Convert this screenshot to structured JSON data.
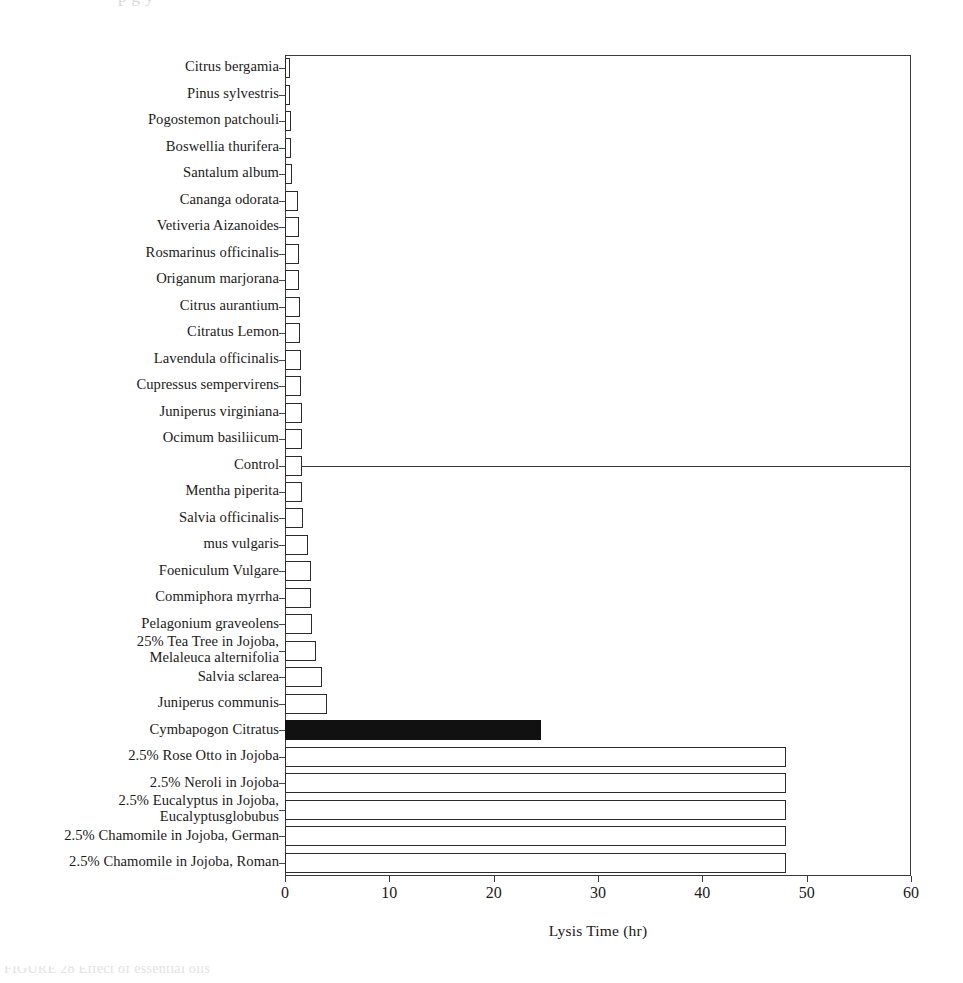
{
  "page": {
    "top_bleed_text": "p         g        y",
    "bottom_caption_fragment": "FIGURE  28    Effect of essential oils"
  },
  "chart_data": {
    "type": "bar",
    "orientation": "horizontal",
    "title": "",
    "xlabel": "Lysis Time (hr)",
    "ylabel": "",
    "xlim": [
      0,
      60
    ],
    "xticks": [
      0,
      10,
      20,
      30,
      40,
      50,
      60
    ],
    "xtick_labels": [
      "0",
      "10",
      "20",
      "30",
      "40",
      "50",
      "60"
    ],
    "grid": false,
    "legend": null,
    "highlight_color": "#111111",
    "bar_color": "#ffffff",
    "bar_edge_color": "#2b2b2b",
    "reference_line": {
      "category": "Control",
      "value": 1.6,
      "style": "solid"
    },
    "categories": [
      "Citrus bergamia",
      "Pinus sylvestris",
      "Pogostemon patchouli",
      "Boswellia thurifera",
      "Santalum album",
      "Cananga odorata",
      "Vetiveria Aizanoides",
      "Rosmarinus officinalis",
      "Origanum marjorana",
      "Citrus aurantium",
      "Citratus Lemon",
      "Lavendula officinalis",
      "Cupressus sempervirens",
      "Juniperus virginiana",
      "Ocimum basiliicum",
      "Control",
      "Mentha piperita",
      "Salvia officinalis",
      "mus vulgaris",
      "Foeniculum Vulgare",
      "Commiphora myrrha",
      "Pelagonium graveolens",
      "25% Tea Tree in Jojoba,\nMelaleuca alternifolia",
      "Salvia sclarea",
      "Juniperus communis",
      "Cymbapogon Citratus",
      "2.5% Rose Otto in Jojoba",
      "2.5% Neroli in Jojoba",
      "2.5% Eucalyptus in Jojoba,\nEucalyptusglobubus",
      "2.5% Chamomile in Jojoba, German",
      "2.5% Chamomile in Jojoba, Roman"
    ],
    "values": [
      0.5,
      0.5,
      0.6,
      0.6,
      0.7,
      1.2,
      1.3,
      1.3,
      1.3,
      1.4,
      1.4,
      1.5,
      1.5,
      1.6,
      1.6,
      1.6,
      1.6,
      1.7,
      2.2,
      2.5,
      2.5,
      2.6,
      3.0,
      3.5,
      4.0,
      24.5,
      48.0,
      48.0,
      48.0,
      48.0,
      48.0
    ],
    "highlighted": [
      false,
      false,
      false,
      false,
      false,
      false,
      false,
      false,
      false,
      false,
      false,
      false,
      false,
      false,
      false,
      false,
      false,
      false,
      false,
      false,
      false,
      false,
      false,
      false,
      false,
      true,
      false,
      false,
      false,
      false,
      false
    ]
  }
}
